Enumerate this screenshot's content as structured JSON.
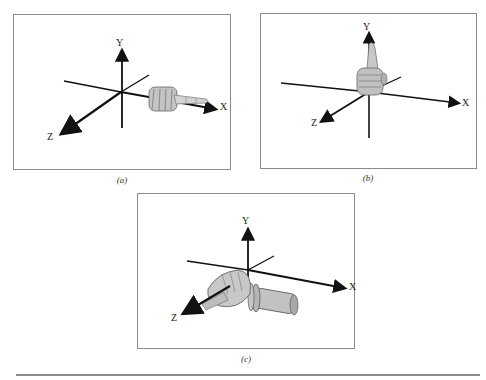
{
  "figure": {
    "panels": [
      {
        "id": "a",
        "caption": "(a)",
        "axes": {
          "x_label": "X",
          "y_label": "Y",
          "z_label": "Z"
        },
        "hand_pose": "index finger pointing along +X axis"
      },
      {
        "id": "b",
        "caption": "(b)",
        "axes": {
          "x_label": "X",
          "y_label": "Y",
          "z_label": "Z"
        },
        "hand_pose": "thumb pointing up along +Y axis"
      },
      {
        "id": "c",
        "caption": "(c)",
        "axes": {
          "x_label": "X",
          "y_label": "Y",
          "z_label": "Z"
        },
        "hand_pose": "hand with wrist cylinder, index finger pointing along +Z axis"
      }
    ]
  },
  "colors": {
    "frame": "#8a8a8a",
    "axis": "#111111",
    "hand": "#b8b8b8",
    "rule": "#8c8c8c"
  }
}
